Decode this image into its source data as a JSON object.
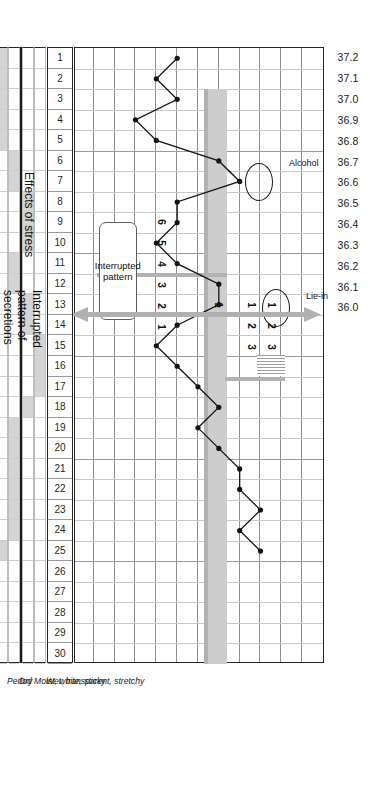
{
  "chart_data": {
    "type": "line",
    "xlabel": "Cycle day",
    "ylabel": "Temperature (°C)",
    "ylim": [
      36.0,
      37.2
    ],
    "xlim": [
      1,
      30
    ],
    "grid": true,
    "legend": "none",
    "y_ticks": [
      "37.2",
      "37.1",
      "37.0",
      "36.9",
      "36.8",
      "36.7",
      "36.6",
      "36.5",
      "36.4",
      "36.3",
      "36.2",
      "36.1",
      "36.0"
    ],
    "x_ticks": [
      "1",
      "2",
      "3",
      "4",
      "5",
      "6",
      "7",
      "8",
      "9",
      "10",
      "11",
      "12",
      "13",
      "14",
      "15",
      "16",
      "17",
      "18",
      "19",
      "20",
      "21",
      "22",
      "23",
      "24",
      "25",
      "26",
      "27",
      "28",
      "29",
      "30"
    ],
    "series": [
      {
        "name": "Basal body temperature",
        "x": [
          1,
          2,
          3,
          4,
          5,
          6,
          7,
          8,
          9,
          10,
          11,
          12,
          13,
          14,
          15,
          16,
          17,
          18,
          19,
          20,
          21,
          22,
          23,
          24,
          25
        ],
        "values": [
          36.5,
          36.4,
          36.5,
          36.3,
          36.4,
          36.7,
          36.8,
          36.5,
          36.5,
          36.4,
          36.5,
          36.7,
          36.7,
          36.5,
          36.4,
          36.5,
          36.6,
          36.7,
          36.6,
          36.7,
          36.8,
          36.8,
          36.9,
          36.8,
          36.9
        ]
      }
    ],
    "coverline_temperature": "36.6",
    "coverline_start_day": 17,
    "annotations": [
      {
        "label": "Alcohol",
        "day": 7,
        "temperature": 36.8
      },
      {
        "label": "Lie-in",
        "day": 13,
        "temperature": 36.7
      },
      {
        "label": "Interrupted pattern",
        "day": 11
      }
    ],
    "rule_numbers_row_a": [
      "1",
      "2",
      "3"
    ],
    "rule_numbers_row_b": [
      "1",
      "2",
      "3"
    ],
    "rule_numbers_coverline": [
      "1"
    ],
    "rule_numbers_pre": [
      "6",
      "5",
      "4",
      "3",
      "2",
      "1"
    ]
  },
  "scale": {
    "name": "temperature-scale",
    "ticks": [
      "37.2",
      "37.1",
      "37.0",
      "36.9",
      "36.8",
      "36.7",
      "36.6",
      "36.5",
      "36.4",
      "36.3",
      "36.2",
      "36.1",
      "36.0"
    ]
  },
  "days": {
    "name": "cycle-day-row",
    "values": [
      "1",
      "2",
      "3",
      "4",
      "5",
      "6",
      "7",
      "8",
      "9",
      "10",
      "11",
      "12",
      "13",
      "14",
      "15",
      "16",
      "17",
      "18",
      "19",
      "20",
      "21",
      "22",
      "23",
      "24",
      "25",
      "26",
      "27",
      "28",
      "29",
      "30"
    ]
  },
  "secretion_rows": [
    {
      "label": "Wet, transparent, stretchy",
      "days": [
        15,
        16,
        17
      ]
    },
    {
      "label": "Moist, white, sticky",
      "days": [
        8,
        9,
        10,
        13,
        14,
        18
      ]
    },
    {
      "label": "Dry",
      "days": [
        6,
        7,
        11,
        12,
        19,
        20,
        21,
        22,
        23,
        24
      ]
    },
    {
      "label": "Period",
      "days": [
        1,
        2,
        3,
        4,
        5,
        25
      ]
    }
  ],
  "captions": {
    "stress": "Effects of stress",
    "secretions": "Interrupted\npattern of\nsecretions"
  },
  "callouts": {
    "interrupted": "Interrupted\npattern"
  },
  "point_notes": {
    "alcohol": "Alcohol",
    "lie_in": "Lie-in"
  },
  "rule_numbers": {
    "top_a": [
      "1",
      "2",
      "3"
    ],
    "top_b": [
      "1",
      "2",
      "3"
    ],
    "cover": [
      "1"
    ],
    "descending": [
      "6",
      "5",
      "4",
      "3",
      "2",
      "1"
    ]
  },
  "colors": {
    "ink": "#1b1b1b",
    "grid": "#c9c9c9",
    "grid_major": "#9a9a9a",
    "fill": "#d4d4d4",
    "bar": "#b2b2b2",
    "arrow": "#b0b0b0"
  }
}
